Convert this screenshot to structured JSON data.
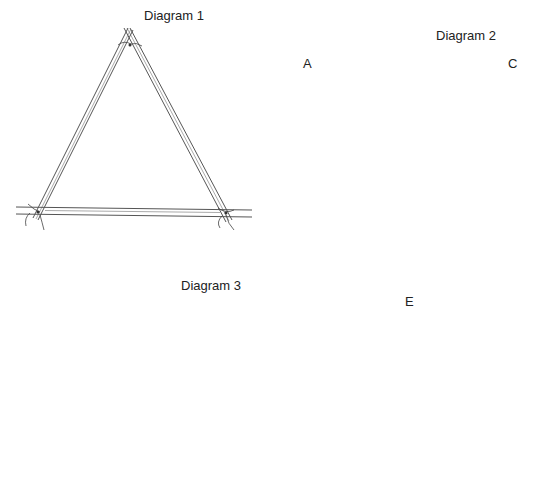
{
  "diagrams": [
    {
      "id": 1,
      "title": "Diagram 1",
      "shape": "triangle"
    },
    {
      "id": 2,
      "title": "Diagram 2",
      "shape": "six-pointed star (two overlapping triangles)",
      "point_labels": {
        "top_left": "A",
        "top_right": "C",
        "bottom": "E"
      }
    },
    {
      "id": 3,
      "title": "Diagram 3",
      "shape": "six-pointed star (two overlapping triangles)"
    }
  ]
}
